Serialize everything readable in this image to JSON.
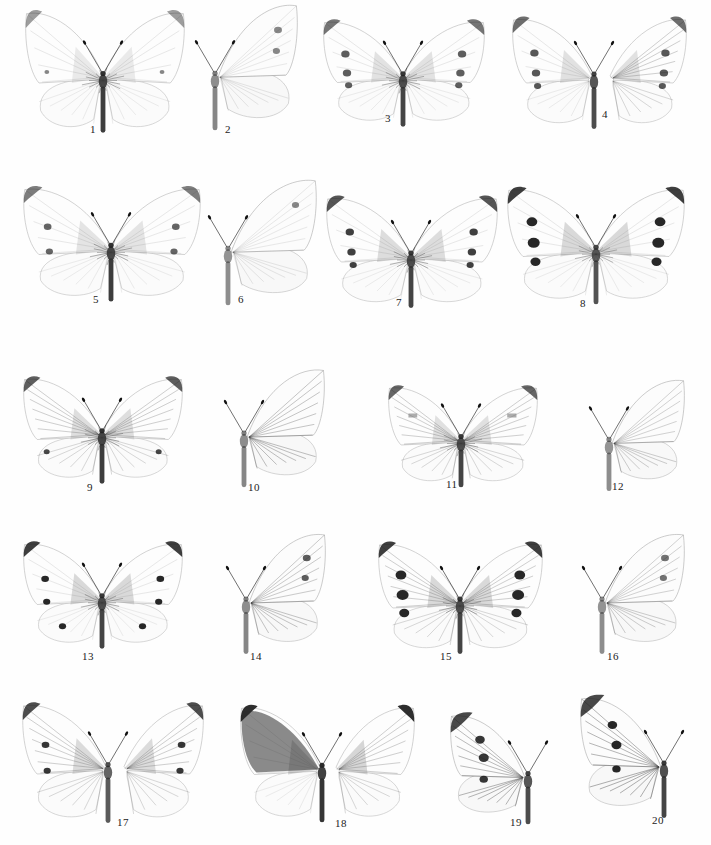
{
  "plate": {
    "background": "#fefefe",
    "ink": "#1a1a1a",
    "figures": [
      {
        "num": "1",
        "label": "1",
        "view": "upperside",
        "x": 25,
        "y": 28,
        "w": 160,
        "h": 110,
        "cx": 103,
        "spots": "faint-apex",
        "labelX": 90,
        "labelY": 133,
        "dark": 0.25,
        "body": 0.9
      },
      {
        "num": "2",
        "label": "2",
        "view": "underside",
        "x": 193,
        "y": 30,
        "w": 105,
        "h": 105,
        "cx": 215,
        "spots": "two-fore",
        "labelX": 225,
        "labelY": 133,
        "dark": 0.2,
        "body": 0.4
      },
      {
        "num": "3",
        "label": "3",
        "view": "upperside",
        "x": 323,
        "y": 35,
        "w": 162,
        "h": 95,
        "cx": 403,
        "spots": "three-fore",
        "labelX": 385,
        "labelY": 122,
        "dark": 0.5,
        "body": 0.85
      },
      {
        "num": "4",
        "label": "4",
        "view": "split",
        "x": 512,
        "y": 33,
        "w": 175,
        "h": 100,
        "cx": 594,
        "spots": "three-fore",
        "labelX": 602,
        "labelY": 118,
        "dark": 0.55,
        "body": 0.8
      },
      {
        "num": "5",
        "label": "5",
        "view": "upperside",
        "x": 23,
        "y": 203,
        "w": 178,
        "h": 103,
        "cx": 111,
        "spots": "two-fore",
        "labelX": 93,
        "labelY": 303,
        "dark": 0.45,
        "body": 0.9
      },
      {
        "num": "6",
        "label": "6",
        "view": "underside",
        "x": 205,
        "y": 205,
        "w": 112,
        "h": 105,
        "cx": 228,
        "spots": "one-fore",
        "labelX": 238,
        "labelY": 303,
        "dark": 0.2,
        "body": 0.35
      },
      {
        "num": "7",
        "label": "7",
        "view": "upperside",
        "x": 326,
        "y": 212,
        "w": 172,
        "h": 100,
        "cx": 411,
        "spots": "three-fore",
        "labelX": 396,
        "labelY": 306,
        "dark": 0.7,
        "body": 0.85
      },
      {
        "num": "8",
        "label": "8",
        "view": "upperside",
        "x": 507,
        "y": 204,
        "w": 178,
        "h": 105,
        "cx": 596,
        "spots": "heavy-band",
        "labelX": 580,
        "labelY": 307,
        "dark": 0.85,
        "body": 0.75
      },
      {
        "num": "9",
        "label": "9",
        "view": "veined",
        "x": 23,
        "y": 392,
        "w": 160,
        "h": 95,
        "cx": 102,
        "spots": "faint-hind",
        "labelX": 87,
        "labelY": 491,
        "dark": 0.65,
        "body": 0.9
      },
      {
        "num": "10",
        "label": "10",
        "view": "underside-veined",
        "x": 218,
        "y": 393,
        "w": 107,
        "h": 98,
        "cx": 244,
        "spots": "none",
        "labelX": 248,
        "labelY": 491,
        "dark": 0.6,
        "body": 0.4
      },
      {
        "num": "11",
        "label": "11",
        "view": "veined",
        "x": 388,
        "y": 400,
        "w": 150,
        "h": 90,
        "cx": 461,
        "spots": "grey-band",
        "labelX": 446,
        "labelY": 488,
        "dark": 0.6,
        "body": 0.85
      },
      {
        "num": "12",
        "label": "12",
        "view": "underside-veined",
        "x": 585,
        "y": 402,
        "w": 100,
        "h": 92,
        "cx": 609,
        "spots": "none",
        "labelX": 612,
        "labelY": 490,
        "dark": 0.35,
        "body": 0.35
      },
      {
        "num": "13",
        "label": "13",
        "view": "upperside",
        "x": 23,
        "y": 557,
        "w": 160,
        "h": 95,
        "cx": 102,
        "spots": "apex-two-fore-hind",
        "labelX": 82,
        "labelY": 660,
        "dark": 0.85,
        "body": 0.85
      },
      {
        "num": "14",
        "label": "14",
        "view": "underside-veined",
        "x": 218,
        "y": 558,
        "w": 108,
        "h": 100,
        "cx": 246,
        "spots": "two-fore",
        "labelX": 250,
        "labelY": 660,
        "dark": 0.5,
        "body": 0.4
      },
      {
        "num": "15",
        "label": "15",
        "view": "veined",
        "x": 378,
        "y": 558,
        "w": 165,
        "h": 100,
        "cx": 460,
        "spots": "heavy-three",
        "labelX": 440,
        "labelY": 660,
        "dark": 0.85,
        "body": 0.85
      },
      {
        "num": "16",
        "label": "16",
        "view": "underside-veined",
        "x": 578,
        "y": 558,
        "w": 107,
        "h": 100,
        "cx": 602,
        "spots": "two-fore",
        "labelX": 607,
        "labelY": 660,
        "dark": 0.35,
        "body": 0.35
      },
      {
        "num": "17",
        "label": "17",
        "view": "split-veined",
        "x": 22,
        "y": 720,
        "w": 182,
        "h": 108,
        "cx": 108,
        "spots": "apex-two-fore",
        "labelX": 117,
        "labelY": 826,
        "dark": 0.75,
        "body": 0.7
      },
      {
        "num": "18",
        "label": "18",
        "view": "split-dark",
        "x": 238,
        "y": 722,
        "w": 177,
        "h": 105,
        "cx": 322,
        "spots": "dark-fore",
        "labelX": 335,
        "labelY": 827,
        "dark": 0.95,
        "body": 0.95
      },
      {
        "num": "19",
        "label": "19",
        "view": "half",
        "x": 450,
        "y": 737,
        "w": 105,
        "h": 90,
        "cx": 528,
        "spots": "three-fore-dark",
        "labelX": 510,
        "labelY": 826,
        "dark": 0.8,
        "body": 0.8
      },
      {
        "num": "20",
        "label": "20",
        "view": "half",
        "x": 580,
        "y": 722,
        "w": 108,
        "h": 100,
        "cx": 664,
        "spots": "three-fore-dark",
        "labelX": 652,
        "labelY": 824,
        "dark": 0.9,
        "body": 0.85
      }
    ]
  }
}
